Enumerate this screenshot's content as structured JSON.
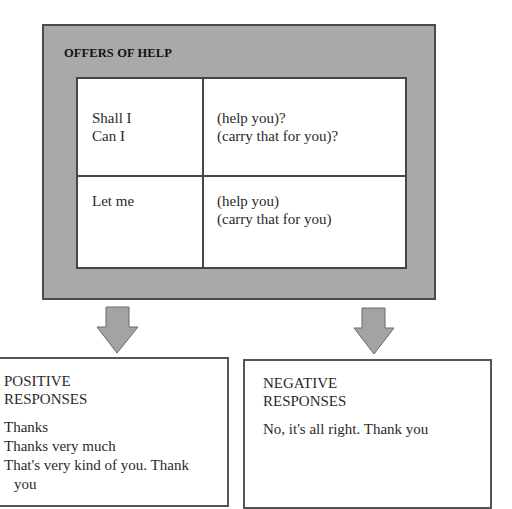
{
  "offers": {
    "title": "OFFERS OF HELP",
    "rows": [
      {
        "left": [
          "Shall I",
          "Can I"
        ],
        "right": [
          "(help you)?",
          "(carry that for you)?"
        ]
      },
      {
        "left": [
          "Let me"
        ],
        "right": [
          "(help you)",
          "(carry that for you)"
        ]
      }
    ]
  },
  "positive": {
    "heading": [
      "POSITIVE",
      "RESPONSES"
    ],
    "items": [
      "Thanks",
      "Thanks very much",
      "That's very kind of you. Thank",
      "you"
    ]
  },
  "negative": {
    "heading": [
      "NEGATIVE",
      "RESPONSES"
    ],
    "items": [
      "No, it's all right. Thank you"
    ]
  },
  "colors": {
    "frame_gray": "#a9a9a9",
    "arrow_gray": "#a3a3a3",
    "border": "#454545"
  }
}
